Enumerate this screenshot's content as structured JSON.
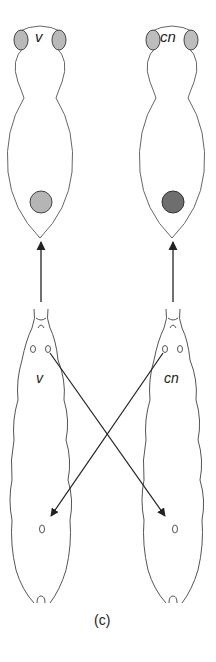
{
  "figure": {
    "caption": "(c)",
    "adults": [
      {
        "label": "v",
        "eye_color": "#b9b9b9",
        "abdominal_disc_color": "#b5b5b5"
      },
      {
        "label": "cn",
        "eye_color": "#bdbdbd",
        "abdominal_disc_color": "#6e6e6e"
      }
    ],
    "larvae": [
      {
        "label": "v"
      },
      {
        "label": "cn"
      }
    ],
    "colors": {
      "outline": "#555555",
      "arrow": "#333333",
      "background": "#ffffff"
    }
  }
}
